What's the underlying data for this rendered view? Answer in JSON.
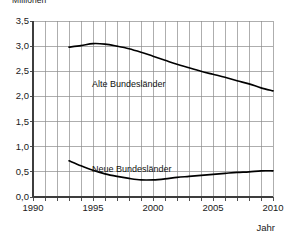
{
  "unit_caption": "Millionen",
  "axis_caption_x": "Jahr",
  "chart_data": {
    "type": "line",
    "title": "",
    "subtitle": "",
    "xlabel": "Jahr",
    "ylabel": "Millionen",
    "grid": true,
    "legend_position": "inline",
    "xlim": [
      1990,
      2010
    ],
    "ylim": [
      0.0,
      3.5
    ],
    "y_ticks": [
      0.0,
      0.5,
      1.0,
      1.5,
      2.0,
      2.5,
      3.0,
      3.5
    ],
    "y_tick_labels": [
      "0,0",
      "0,5",
      "1,0",
      "1,5",
      "2,0",
      "2,5",
      "3,0",
      "3,5"
    ],
    "x_ticks": [
      1990,
      1995,
      2000,
      2005,
      2010
    ],
    "x_tick_labels": [
      "1990",
      "1995",
      "2000",
      "2005",
      "2010"
    ],
    "x_minor_tick_step": 1,
    "x": [
      1993,
      1994,
      1995,
      1996,
      1997,
      1998,
      1999,
      2000,
      2001,
      2002,
      2003,
      2004,
      2005,
      2006,
      2007,
      2008,
      2009,
      2010
    ],
    "series": [
      {
        "name": "Alte Bundesländer",
        "color": "#000000",
        "values": [
          2.98,
          3.01,
          3.05,
          3.04,
          3.0,
          2.95,
          2.88,
          2.8,
          2.72,
          2.64,
          2.57,
          2.5,
          2.44,
          2.38,
          2.31,
          2.25,
          2.17,
          2.11
        ]
      },
      {
        "name": "Neue Bundesländer",
        "color": "#000000",
        "values": [
          0.72,
          0.62,
          0.53,
          0.46,
          0.41,
          0.37,
          0.34,
          0.34,
          0.36,
          0.39,
          0.41,
          0.43,
          0.45,
          0.47,
          0.49,
          0.5,
          0.52,
          0.52
        ]
      }
    ]
  }
}
